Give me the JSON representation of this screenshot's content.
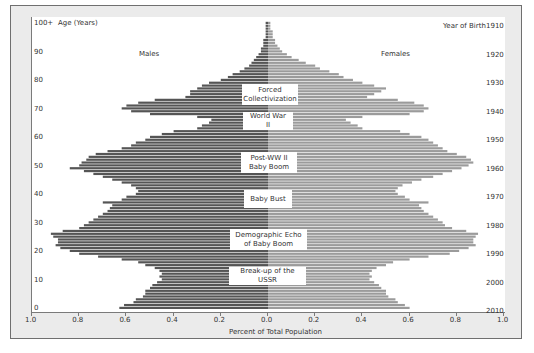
{
  "chart_data": {
    "type": "bar",
    "orientation": "horizontal-population-pyramid",
    "title": "",
    "xlabel": "Percent of Total Population",
    "ylabel_left": "Age (Years)",
    "ylabel_right": "Year of Birth",
    "xlim": [
      -1.0,
      1.0
    ],
    "x_tick_labels": [
      "1.0",
      "0.8",
      "0.6",
      "0.4",
      "0.2",
      "0.0",
      "0.2",
      "0.4",
      "0.6",
      "0.8",
      "1.0"
    ],
    "age_tick_labels": [
      "0",
      "10",
      "20",
      "30",
      "40",
      "50",
      "60",
      "70",
      "80",
      "90",
      "100+"
    ],
    "birth_year_tick_labels": [
      "2010",
      "2000",
      "1990",
      "1980",
      "1970",
      "1960",
      "1950",
      "1940",
      "1930",
      "1920",
      "1910"
    ],
    "legend": {
      "left": "Males",
      "right": "Females"
    },
    "colors": {
      "males": "#555555",
      "females": "#9b9b9b"
    },
    "ages": [
      0,
      1,
      2,
      3,
      4,
      5,
      6,
      7,
      8,
      9,
      10,
      11,
      12,
      13,
      14,
      15,
      16,
      17,
      18,
      19,
      20,
      21,
      22,
      23,
      24,
      25,
      26,
      27,
      28,
      29,
      30,
      31,
      32,
      33,
      34,
      35,
      36,
      37,
      38,
      39,
      40,
      41,
      42,
      43,
      44,
      45,
      46,
      47,
      48,
      49,
      50,
      51,
      52,
      53,
      54,
      55,
      56,
      57,
      58,
      59,
      60,
      61,
      62,
      63,
      64,
      65,
      66,
      67,
      68,
      69,
      70,
      71,
      72,
      73,
      74,
      75,
      76,
      77,
      78,
      79,
      80,
      81,
      82,
      83,
      84,
      85,
      86,
      87,
      88,
      89,
      90,
      91,
      92,
      93,
      94,
      95,
      96,
      97,
      98,
      99,
      100
    ],
    "series": [
      {
        "name": "Males",
        "values": [
          0.63,
          0.61,
          0.57,
          0.56,
          0.53,
          0.52,
          0.52,
          0.5,
          0.49,
          0.47,
          0.45,
          0.46,
          0.45,
          0.46,
          0.48,
          0.52,
          0.55,
          0.62,
          0.72,
          0.8,
          0.84,
          0.88,
          0.9,
          0.89,
          0.89,
          0.91,
          0.92,
          0.87,
          0.8,
          0.78,
          0.76,
          0.74,
          0.72,
          0.7,
          0.68,
          0.67,
          0.66,
          0.7,
          0.62,
          0.6,
          0.56,
          0.55,
          0.56,
          0.58,
          0.62,
          0.66,
          0.7,
          0.74,
          0.78,
          0.84,
          0.8,
          0.79,
          0.77,
          0.76,
          0.73,
          0.68,
          0.62,
          0.58,
          0.56,
          0.52,
          0.5,
          0.45,
          0.4,
          0.3,
          0.28,
          0.25,
          0.24,
          0.3,
          0.5,
          0.58,
          0.62,
          0.6,
          0.55,
          0.48,
          0.35,
          0.33,
          0.33,
          0.3,
          0.28,
          0.25,
          0.2,
          0.17,
          0.15,
          0.12,
          0.1,
          0.08,
          0.07,
          0.06,
          0.05,
          0.04,
          0.03,
          0.03,
          0.02,
          0.02,
          0.02,
          0.01,
          0.01,
          0.01,
          0.01,
          0.01,
          0.01
        ]
      },
      {
        "name": "Females",
        "values": [
          0.6,
          0.58,
          0.55,
          0.54,
          0.51,
          0.5,
          0.5,
          0.48,
          0.47,
          0.45,
          0.43,
          0.44,
          0.43,
          0.44,
          0.46,
          0.5,
          0.53,
          0.6,
          0.68,
          0.77,
          0.81,
          0.85,
          0.88,
          0.87,
          0.87,
          0.88,
          0.89,
          0.84,
          0.78,
          0.75,
          0.74,
          0.72,
          0.7,
          0.68,
          0.66,
          0.65,
          0.64,
          0.68,
          0.6,
          0.58,
          0.55,
          0.54,
          0.55,
          0.57,
          0.61,
          0.65,
          0.7,
          0.74,
          0.78,
          0.82,
          0.85,
          0.87,
          0.86,
          0.84,
          0.8,
          0.76,
          0.74,
          0.72,
          0.7,
          0.68,
          0.65,
          0.6,
          0.56,
          0.4,
          0.38,
          0.35,
          0.33,
          0.4,
          0.6,
          0.66,
          0.68,
          0.66,
          0.62,
          0.55,
          0.42,
          0.45,
          0.48,
          0.5,
          0.45,
          0.4,
          0.36,
          0.32,
          0.3,
          0.26,
          0.22,
          0.2,
          0.16,
          0.13,
          0.1,
          0.08,
          0.06,
          0.05,
          0.04,
          0.03,
          0.03,
          0.02,
          0.02,
          0.02,
          0.01,
          0.01,
          0.01
        ]
      }
    ],
    "annotations": [
      {
        "text": "Forced Collectivization",
        "age_center": 76
      },
      {
        "text": "World War II",
        "age_center": 66
      },
      {
        "text": "Post-WW II Baby Boom",
        "age_center": 52
      },
      {
        "text": "Baby  Bust",
        "age_center": 38
      },
      {
        "text": "Demographic Echo of Baby Boom",
        "age_center": 25
      },
      {
        "text": "Break-up of the USSR",
        "age_center": 13
      }
    ]
  },
  "labels": {
    "age_axis_title": "Age (Years)",
    "birth_axis_title": "Year of Birth",
    "males": "Males",
    "females": "Females",
    "x_axis_title": "Percent of Total Population",
    "ann_forced_1": "Forced",
    "ann_forced_2": "Collectivization",
    "ann_wwii": "World War II",
    "ann_boom_1": "Post-WW II",
    "ann_boom_2": "Baby Boom",
    "ann_bust": "Baby  Bust",
    "ann_echo_1": "Demographic Echo",
    "ann_echo_2": "of Baby Boom",
    "ann_ussr": "Break-up of the USSR"
  }
}
